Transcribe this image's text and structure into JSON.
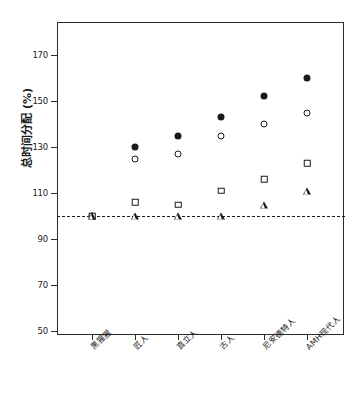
{
  "chart_data": {
    "type": "scatter",
    "title": "",
    "xlabel": "",
    "ylabel": "总时间分配 (%)",
    "categories": [
      "黑猩猩",
      "匠人",
      "直立人",
      "古人",
      "尼安德特人",
      "AMH现代人"
    ],
    "ylim": [
      50,
      170
    ],
    "yticks": [
      50,
      70,
      90,
      110,
      130,
      150,
      170
    ],
    "grid": false,
    "legend": "none",
    "reference_line": {
      "value": 100,
      "style": "dashed",
      "color": "#1a1a1a"
    },
    "series": [
      {
        "name": "filled-circle",
        "marker": "filled-circle",
        "values": [
          100,
          130,
          135,
          143,
          152,
          160
        ]
      },
      {
        "name": "open-circle",
        "marker": "open-circle",
        "values": [
          100,
          125,
          127,
          135,
          140,
          145
        ]
      },
      {
        "name": "open-square",
        "marker": "open-square",
        "values": [
          100,
          106,
          105,
          111,
          116,
          123
        ]
      },
      {
        "name": "open-triangle",
        "marker": "open-triangle",
        "values": [
          100,
          100,
          100,
          100,
          105,
          111
        ]
      }
    ]
  },
  "axes": {
    "y_label": "总时间分配 (%)",
    "y_tick_labels": [
      "170",
      "150",
      "130",
      "110",
      "90",
      "70",
      "50"
    ],
    "x_tick_labels": [
      "黑猩猩",
      "匠人",
      "直立人",
      "古人",
      "尼安德特人",
      "AMH现代人"
    ]
  }
}
